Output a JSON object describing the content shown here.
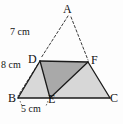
{
  "figure": {
    "kind": "geometry-diagram",
    "background_color": "#fdfdfd",
    "stroke_color": "#1a1a1a",
    "dashed_color": "#3a3a3a",
    "shade_dark": "#a9a9a9",
    "shade_light": "#d8d8d8"
  },
  "vertices": [
    {
      "id": "A",
      "label": "A",
      "x": 68,
      "y": 12
    },
    {
      "id": "D",
      "label": "D",
      "x": 40,
      "y": 61
    },
    {
      "id": "F",
      "label": "F",
      "x": 88,
      "y": 62
    },
    {
      "id": "B",
      "label": "B",
      "x": 18,
      "y": 98
    },
    {
      "id": "E",
      "label": "E",
      "x": 50,
      "y": 98
    },
    {
      "id": "C",
      "label": "C",
      "x": 110,
      "y": 98
    }
  ],
  "segments": [
    {
      "id": "AD",
      "from": "A",
      "to": "D",
      "style": "dashed"
    },
    {
      "id": "DB",
      "from": "D",
      "to": "B",
      "style": "dashed"
    },
    {
      "id": "AF",
      "from": "A",
      "to": "F",
      "style": "dashed"
    },
    {
      "id": "BD",
      "from": "B",
      "to": "D",
      "style": "solid"
    },
    {
      "id": "DE",
      "from": "D",
      "to": "E",
      "style": "solid"
    },
    {
      "id": "DF",
      "from": "D",
      "to": "F",
      "style": "solid"
    },
    {
      "id": "EF",
      "from": "E",
      "to": "F",
      "style": "solid"
    },
    {
      "id": "FC",
      "from": "F",
      "to": "C",
      "style": "solid"
    },
    {
      "id": "BC",
      "from": "B",
      "to": "C",
      "style": "solid"
    }
  ],
  "regions": [
    {
      "id": "BDE",
      "points": "18,98 40,61 50,98",
      "shade": "light"
    },
    {
      "id": "EFC",
      "points": "50,98 88,62 110,98",
      "shade": "light"
    },
    {
      "id": "DEF",
      "points": "40,61 50,98 88,62",
      "shade": "dark"
    }
  ],
  "measurements": [
    {
      "id": "AD",
      "text": "7 cm",
      "segment": "AD"
    },
    {
      "id": "DB",
      "text": "8 cm",
      "segment": "DB"
    },
    {
      "id": "BE",
      "text": "5 cm",
      "segment": "BE"
    }
  ]
}
